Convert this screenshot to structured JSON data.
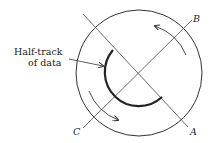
{
  "diagram": {
    "annotation": {
      "line1": "Half-track",
      "line2": "of data"
    },
    "axis_labels": {
      "A": "A",
      "B": "B",
      "C": "C"
    },
    "colors": {
      "stroke": "#333333",
      "track": "#222222",
      "background": "#ffffff"
    }
  }
}
